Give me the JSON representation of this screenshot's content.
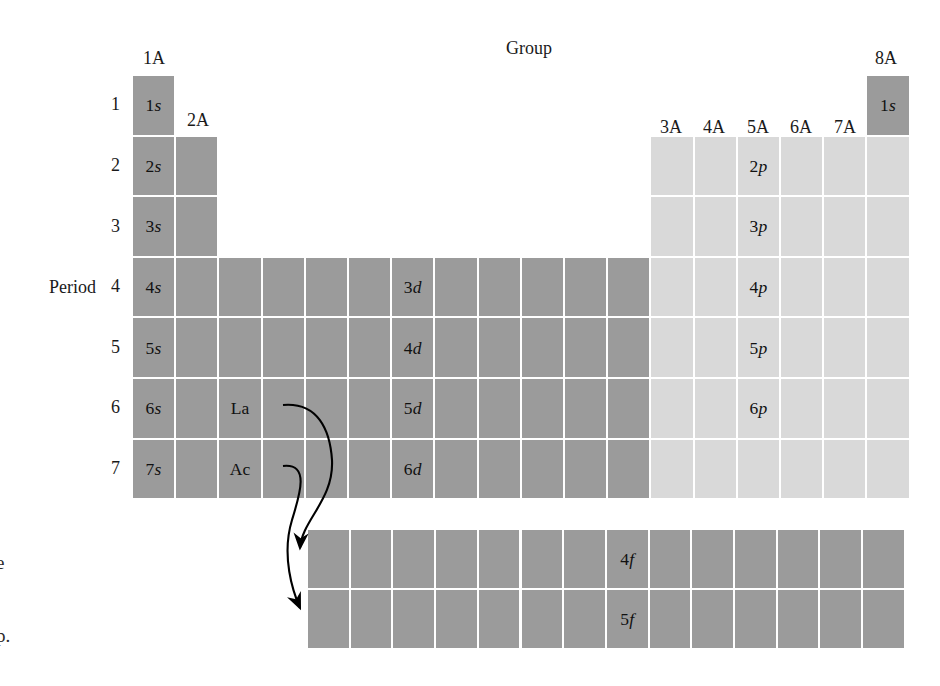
{
  "figure": {
    "type": "periodic-table-orbital-blocks",
    "group_axis_title": "Group",
    "period_axis_title": "Period",
    "group_headers": [
      {
        "label": "1A",
        "x": 154,
        "y": 48
      },
      {
        "label": "2A",
        "x": 198,
        "y": 110
      },
      {
        "label": "3A",
        "x": 671,
        "y": 117
      },
      {
        "label": "4A",
        "x": 714,
        "y": 117
      },
      {
        "label": "5A",
        "x": 758,
        "y": 117
      },
      {
        "label": "6A",
        "x": 801,
        "y": 117
      },
      {
        "label": "7A",
        "x": 845,
        "y": 117
      },
      {
        "label": "8A",
        "x": 886,
        "y": 48
      }
    ],
    "period_numbers": [
      "1",
      "2",
      "3",
      "4",
      "5",
      "6",
      "7"
    ],
    "colors": {
      "s_d_f_block": "#9b9b9b",
      "p_block": "#d9d9d9",
      "cell_border": "#ffffff",
      "background": "#ffffff",
      "text": "#111111",
      "arrow": "#000000"
    },
    "orbital_labels": [
      {
        "text_number": "1",
        "text_letter": "s",
        "block": "s",
        "row": 1,
        "col": 1
      },
      {
        "text_number": "1",
        "text_letter": "s",
        "block": "s",
        "row": 1,
        "col": 18
      },
      {
        "text_number": "2",
        "text_letter": "s",
        "block": "s",
        "row": 2,
        "col": 1
      },
      {
        "text_number": "3",
        "text_letter": "s",
        "block": "s",
        "row": 3,
        "col": 1
      },
      {
        "text_number": "4",
        "text_letter": "s",
        "block": "s",
        "row": 4,
        "col": 1
      },
      {
        "text_number": "5",
        "text_letter": "s",
        "block": "s",
        "row": 5,
        "col": 1
      },
      {
        "text_number": "6",
        "text_letter": "s",
        "block": "s",
        "row": 6,
        "col": 1
      },
      {
        "text_number": "7",
        "text_letter": "s",
        "block": "s",
        "row": 7,
        "col": 1
      },
      {
        "text_number": "2",
        "text_letter": "p",
        "block": "p",
        "row": 2
      },
      {
        "text_number": "3",
        "text_letter": "p",
        "block": "p",
        "row": 3
      },
      {
        "text_number": "4",
        "text_letter": "p",
        "block": "p",
        "row": 4
      },
      {
        "text_number": "5",
        "text_letter": "p",
        "block": "p",
        "row": 5
      },
      {
        "text_number": "6",
        "text_letter": "p",
        "block": "p",
        "row": 6
      },
      {
        "text_number": "3",
        "text_letter": "d",
        "block": "d",
        "row": 4
      },
      {
        "text_number": "4",
        "text_letter": "d",
        "block": "d",
        "row": 5
      },
      {
        "text_number": "5",
        "text_letter": "d",
        "block": "d",
        "row": 6
      },
      {
        "text_number": "6",
        "text_letter": "d",
        "block": "d",
        "row": 7
      },
      {
        "text_number": "4",
        "text_letter": "f",
        "block": "f",
        "row": 1
      },
      {
        "text_number": "5",
        "text_letter": "f",
        "block": "f",
        "row": 2
      }
    ],
    "inline_cell_labels": [
      {
        "label": "La",
        "row": 6,
        "col": 3
      },
      {
        "label": "Ac",
        "row": 7,
        "col": 3
      }
    ],
    "caption_fragments": [
      {
        "text": "e",
        "x": -4,
        "y": 552
      },
      {
        "text": "p.",
        "x": -4,
        "y": 625
      }
    ],
    "arrows": [
      {
        "from": "La",
        "to": "4f-row",
        "d": "M 283 405 C 318 402 330 430 332 460 C 334 500 302 520 300 548"
      },
      {
        "from": "Ac",
        "to": "5f-row",
        "d": "M 283 466 C 310 463 300 494 292 520 C 281 556 293 592 300 608"
      }
    ],
    "main_grid": {
      "x": 132,
      "y": 75,
      "cell_w": 43.2,
      "cell_h": 60.6,
      "cols": 18,
      "rows": 7
    },
    "f_grid": {
      "x": 307,
      "y": 529,
      "cell_w": 42.7,
      "cell_h": 60.0,
      "cols": 14,
      "rows": 2,
      "label_col": 8
    }
  }
}
